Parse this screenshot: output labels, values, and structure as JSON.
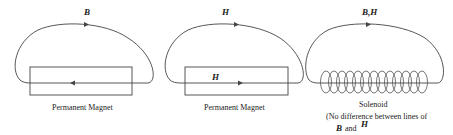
{
  "panels": [
    {
      "id": "panel-1",
      "field_label": "B",
      "inner_label": "",
      "caption": "Permanent Magnet",
      "top_arrow_direction": "right",
      "inner_arrow_direction": "left"
    },
    {
      "id": "panel-2",
      "field_label": "H",
      "inner_label": "H",
      "caption": "Permanent Magnet",
      "top_arrow_direction": "right",
      "inner_arrow_direction": "right"
    },
    {
      "id": "panel-3",
      "field_label": "B,H",
      "caption": "Solenoid",
      "note_line1": "(No difference between lines of",
      "note_b": "B",
      "note_and": "and",
      "note_h": "H",
      "top_arrow_direction": "right"
    }
  ],
  "colors": {
    "line": "#444444",
    "text": "#222222",
    "background": "#ffffff"
  }
}
